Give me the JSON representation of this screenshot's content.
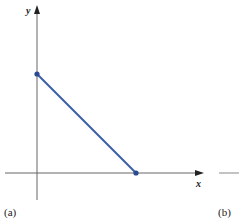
{
  "figure": {
    "panel_a_label": "(a)",
    "panel_b_label": "(b)",
    "x_axis_label": "x",
    "y_axis_label": "y"
  },
  "colors": {
    "axis": "#555555",
    "line": "#3a5fa8",
    "point": "#2a4a90"
  },
  "segment": {
    "start": {
      "label": "y-intercept",
      "px": [
        37,
        74
      ]
    },
    "end": {
      "label": "x-intercept",
      "px": [
        136,
        173
      ]
    }
  }
}
